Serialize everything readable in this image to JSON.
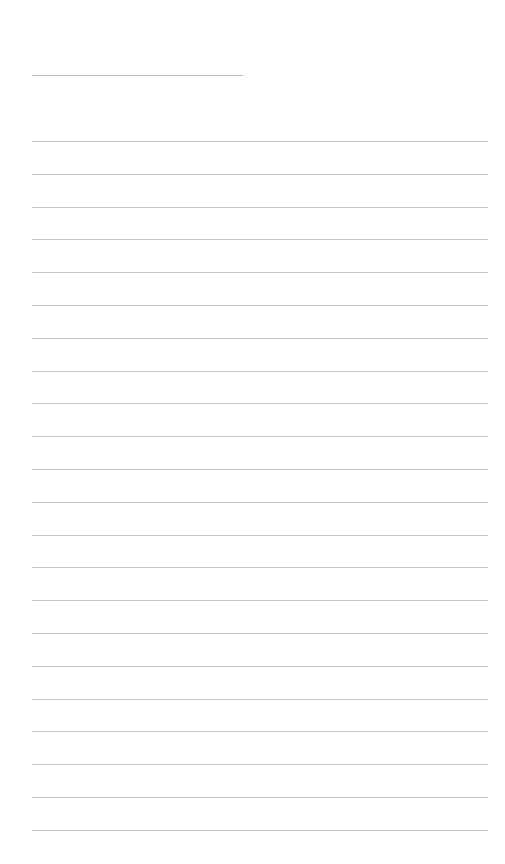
{
  "page": {
    "type": "blank-lined-paper",
    "header_line": {
      "present": true
    },
    "ruled_lines": {
      "count": 22,
      "first_y": 141,
      "spacing": 32.8
    },
    "colors": {
      "background": "#ffffff",
      "line": "#c4c4c4"
    }
  }
}
